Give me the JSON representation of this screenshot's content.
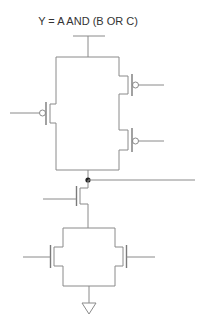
{
  "diagram": {
    "title": "Y = A AND (B OR C)",
    "type": "CMOS transistor schematic",
    "components": {
      "pull_up": [
        {
          "type": "PMOS",
          "position": "left",
          "connection": "parallel with series pair"
        },
        {
          "type": "PMOS",
          "position": "right-top",
          "connection": "series"
        },
        {
          "type": "PMOS",
          "position": "right-bottom",
          "connection": "series"
        }
      ],
      "pull_down": [
        {
          "type": "NMOS",
          "position": "center",
          "connection": "series"
        },
        {
          "type": "NMOS",
          "position": "left",
          "connection": "parallel"
        },
        {
          "type": "NMOS",
          "position": "right",
          "connection": "parallel"
        }
      ],
      "supply": "VDD rail (top)",
      "ground": "ground symbol (bottom)",
      "output_node": "junction dot with output line to the right"
    },
    "colors": {
      "wire": "#8a8a8a",
      "text": "#333333",
      "node": "#222222",
      "background": "#ffffff"
    }
  }
}
